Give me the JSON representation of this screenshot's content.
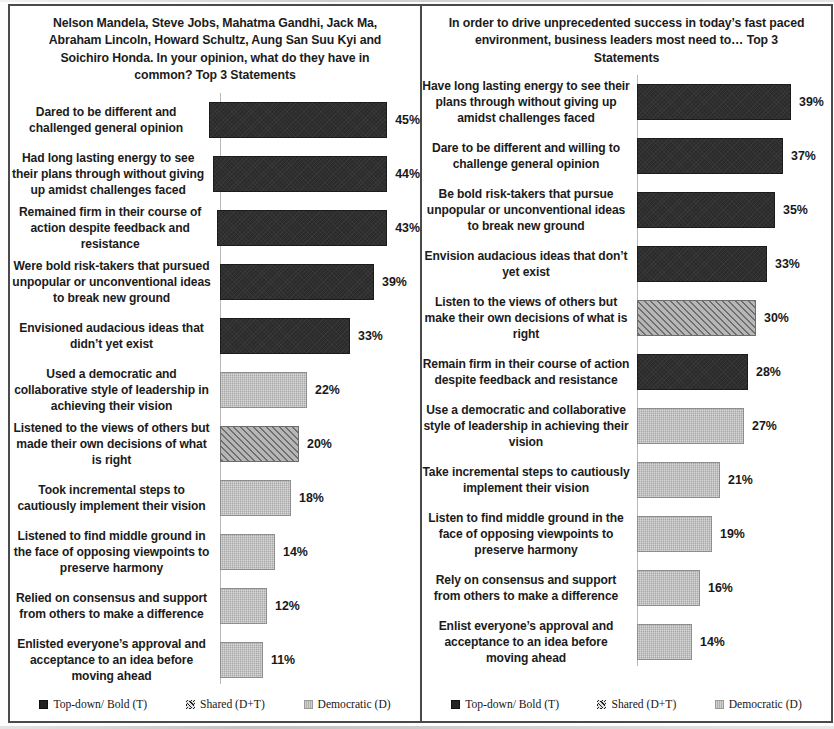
{
  "legend": {
    "items": [
      {
        "key": "topdown",
        "label": "Top-down/ Bold (T)"
      },
      {
        "key": "shared",
        "label": "Shared (D+T)"
      },
      {
        "key": "democratic",
        "label": "Democratic (D)"
      }
    ]
  },
  "chart_data": [
    {
      "type": "bar",
      "orientation": "horizontal",
      "title": "Nelson Mandela, Steve Jobs, Mahatma Gandhi, Jack Ma, Abraham Lincoln, Howard Schultz, Aung San Suu Kyi and Soichiro Honda. In your opinion, what do they have in common? Top 3 Statements",
      "xlabel": "",
      "ylabel": "",
      "xlim": [
        0,
        45
      ],
      "grid": false,
      "legend_position": "bottom",
      "categories": [
        "Dared to be different and challenged general opinion",
        "Had long lasting energy to see their plans through without giving up amidst challenges faced",
        "Remained firm in their course of action despite feedback and resistance",
        "Were bold risk-takers that pursued unpopular or unconventional ideas to break new ground",
        "Envisioned audacious  ideas that didn’t yet exist",
        "Used a democratic and collaborative style of leadership  in achieving their vision",
        "Listened to the views of others but made their own decisions of what is right",
        "Took incremental steps to cautiously implement their vision",
        "Listened to find middle ground in the face of opposing viewpoints  to preserve harmony",
        "Relied on consensus and support from others to make a difference",
        "Enlisted everyone’s approval and acceptance to an idea before moving ahead"
      ],
      "values": [
        45,
        44,
        43,
        39,
        33,
        22,
        20,
        18,
        14,
        12,
        11
      ],
      "value_labels": [
        "45%",
        "44%",
        "43%",
        "39%",
        "33%",
        "22%",
        "20%",
        "18%",
        "14%",
        "12%",
        "11%"
      ],
      "series_type": [
        "topdown",
        "topdown",
        "topdown",
        "topdown",
        "topdown",
        "democratic",
        "shared",
        "democratic",
        "democratic",
        "democratic",
        "democratic"
      ]
    },
    {
      "type": "bar",
      "orientation": "horizontal",
      "title": "In order to drive unprecedented success in today’s fast paced environment, business leaders most need to… Top 3 Statements",
      "xlabel": "",
      "ylabel": "",
      "xlim": [
        0,
        39
      ],
      "grid": false,
      "legend_position": "bottom",
      "categories": [
        "Have long lasting energy to see their plans through without giving up amidst challenges faced",
        "Dare to be different and willing to challenge  general opinion",
        "Be bold risk-takers  that pursue unpopular or unconventional ideas to break new ground",
        "Envision audacious ideas that don’t yet exist",
        "Listen to the views of others but make their own decisions of what is right",
        "Remain firm in their course of action despite feedback and resistance",
        "Use a democratic and collaborative style of leadership  in achieving their vision",
        "Take incremental steps to cautiously implement their vision",
        "Listen to find middle ground in the face of opposing viewpoints  to preserve harmony",
        "Rely on consensus and support from others to make a difference",
        "Enlist everyone’s approval and acceptance to an idea before moving ahead"
      ],
      "values": [
        39,
        37,
        35,
        33,
        30,
        28,
        27,
        21,
        19,
        16,
        14
      ],
      "value_labels": [
        "39%",
        "37%",
        "35%",
        "33%",
        "30%",
        "28%",
        "27%",
        "21%",
        "19%",
        "16%",
        "14%"
      ],
      "series_type": [
        "topdown",
        "topdown",
        "topdown",
        "topdown",
        "shared",
        "topdown",
        "democratic",
        "democratic",
        "democratic",
        "democratic",
        "democratic"
      ]
    }
  ]
}
